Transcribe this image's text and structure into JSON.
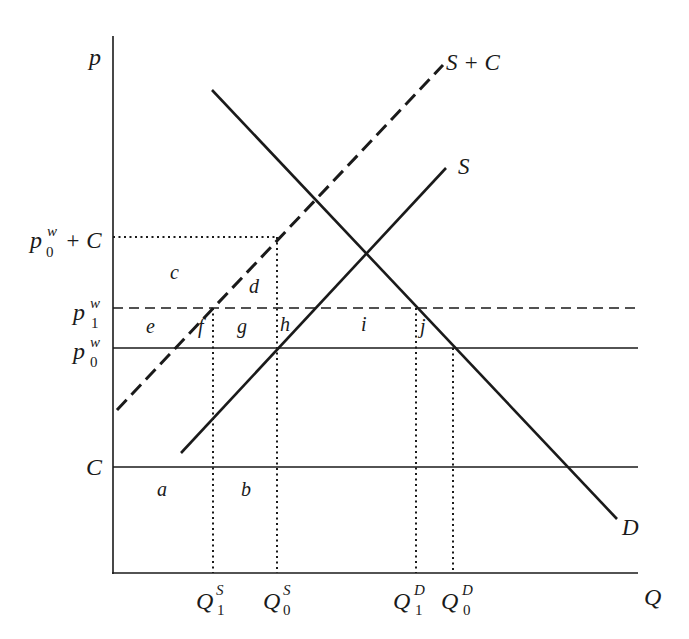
{
  "diagram": {
    "title": "",
    "axes": {
      "y_label": "p",
      "x_label": "Q"
    },
    "curves": {
      "supply_plus_cost": {
        "label": "S + C",
        "style": "dashed"
      },
      "supply": {
        "label": "S",
        "style": "solid"
      },
      "demand": {
        "label": "D",
        "style": "solid"
      }
    },
    "price_levels": {
      "p0w_plus_C": {
        "base": "p",
        "sup": "w",
        "sub": "0",
        "suffix": "+ C",
        "style": "dotted"
      },
      "p1w": {
        "base": "p",
        "sup": "w",
        "sub": "1",
        "style": "dashed"
      },
      "p0w": {
        "base": "p",
        "sup": "w",
        "sub": "0",
        "style": "solid"
      },
      "C": {
        "label": "C",
        "style": "solid"
      }
    },
    "quantities": {
      "Q1S": {
        "base": "Q",
        "sup": "S",
        "sub": "1"
      },
      "Q0S": {
        "base": "Q",
        "sup": "S",
        "sub": "0"
      },
      "Q1D": {
        "base": "Q",
        "sup": "D",
        "sub": "1"
      },
      "Q0D": {
        "base": "Q",
        "sup": "D",
        "sub": "0"
      }
    },
    "areas": {
      "a": "a",
      "b": "b",
      "c": "c",
      "d": "d",
      "e": "e",
      "f": "f",
      "g": "g",
      "h": "h",
      "i": "i",
      "j": "j"
    },
    "colors": {
      "ink": "#1a1a1a",
      "background": "#ffffff"
    }
  }
}
